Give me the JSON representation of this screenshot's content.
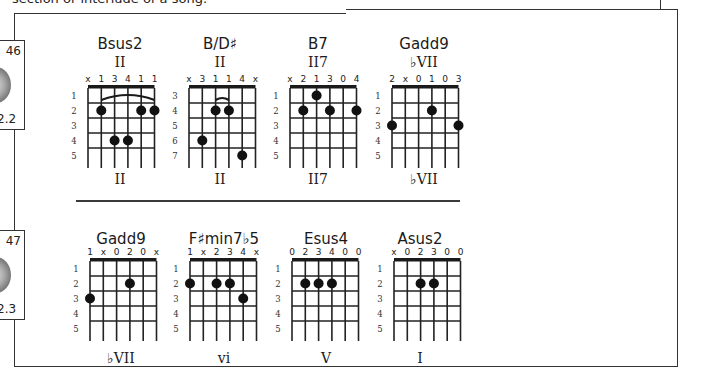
{
  "page": {
    "intro_text_fragment": "section or interlude of a song.",
    "track_tabs": [
      {
        "track_label": "46",
        "time_label": "2.2"
      },
      {
        "track_label": "47",
        "time_label": "2.3"
      }
    ]
  },
  "chords": {
    "row1": [
      {
        "name": "Bsus2",
        "roman_top": "II",
        "roman_bottom": "II",
        "start_fret": 1,
        "fret_numbers": [
          "1",
          "2",
          "3",
          "4",
          "5"
        ],
        "fingers": [
          "x",
          "1",
          "3",
          "4",
          "1",
          "1"
        ],
        "dots": [
          [
            1,
            2
          ],
          [
            4,
            2
          ],
          [
            5,
            2
          ],
          [
            2,
            4
          ],
          [
            3,
            4
          ]
        ],
        "barre": {
          "from": 1,
          "to": 5,
          "fret": 2,
          "style": "arc"
        }
      },
      {
        "name": "B/D♯",
        "roman_top": "II",
        "roman_bottom": "II",
        "start_fret": 3,
        "fret_numbers": [
          "3",
          "4",
          "5",
          "6",
          "7"
        ],
        "fingers": [
          "x",
          "3",
          "1",
          "1",
          "4",
          "x"
        ],
        "dots": [
          [
            2,
            4
          ],
          [
            3,
            4
          ],
          [
            1,
            6
          ],
          [
            4,
            7
          ]
        ],
        "barre": {
          "from": 2,
          "to": 3,
          "fret": 4,
          "style": "small-arc"
        }
      },
      {
        "name": "B7",
        "roman_top": "II7",
        "roman_bottom": "II7",
        "start_fret": 1,
        "fret_numbers": [
          "1",
          "2",
          "3",
          "4",
          "5"
        ],
        "fingers": [
          "x",
          "2",
          "1",
          "3",
          "0",
          "4"
        ],
        "dots": [
          [
            2,
            1
          ],
          [
            1,
            2
          ],
          [
            3,
            2
          ],
          [
            5,
            2
          ]
        ],
        "barre": null
      },
      {
        "name": "Gadd9",
        "roman_top": "♭VII",
        "roman_bottom": "♭VII",
        "start_fret": 1,
        "fret_numbers": [
          "1",
          "2",
          "3",
          "4",
          "5"
        ],
        "fingers": [
          "2",
          "x",
          "0",
          "1",
          "0",
          "3"
        ],
        "dots": [
          [
            3,
            2
          ],
          [
            0,
            3
          ],
          [
            5,
            3
          ]
        ],
        "barre": null
      }
    ],
    "row2": [
      {
        "name": "Gadd9",
        "roman_top": "",
        "roman_bottom": "♭VII",
        "start_fret": 1,
        "fret_numbers": [
          "1",
          "2",
          "3",
          "4",
          "5"
        ],
        "fingers": [
          "1",
          "x",
          "0",
          "2",
          "0",
          "x"
        ],
        "dots": [
          [
            3,
            2
          ],
          [
            0,
            3
          ]
        ],
        "barre": null
      },
      {
        "name": "F♯min7♭5",
        "roman_top": "",
        "roman_bottom": "vi",
        "start_fret": 1,
        "fret_numbers": [
          "1",
          "2",
          "3",
          "4",
          "5"
        ],
        "fingers": [
          "1",
          "x",
          "2",
          "3",
          "4",
          "x"
        ],
        "dots": [
          [
            0,
            2
          ],
          [
            2,
            2
          ],
          [
            3,
            2
          ],
          [
            4,
            3
          ]
        ],
        "barre": null
      },
      {
        "name": "Esus4",
        "roman_top": "",
        "roman_bottom": "V",
        "start_fret": 1,
        "fret_numbers": [
          "1",
          "2",
          "3",
          "4",
          "5"
        ],
        "fingers": [
          "0",
          "2",
          "3",
          "4",
          "0",
          "0"
        ],
        "dots": [
          [
            1,
            2
          ],
          [
            2,
            2
          ],
          [
            3,
            2
          ]
        ],
        "barre": null
      },
      {
        "name": "Asus2",
        "roman_top": "",
        "roman_bottom": "I",
        "start_fret": 1,
        "fret_numbers": [
          "1",
          "2",
          "3",
          "4",
          "5"
        ],
        "fingers": [
          "x",
          "0",
          "2",
          "3",
          "0",
          "0"
        ],
        "dots": [
          [
            2,
            2
          ],
          [
            3,
            2
          ]
        ],
        "barre": null
      }
    ]
  }
}
